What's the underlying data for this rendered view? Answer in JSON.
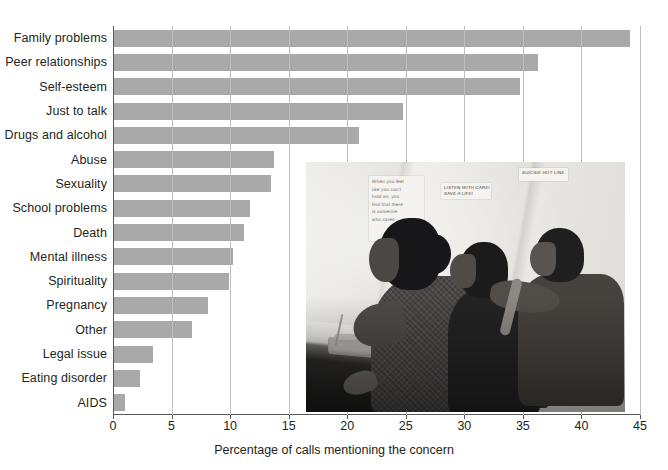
{
  "chart_data": {
    "type": "bar",
    "orientation": "horizontal",
    "title": "",
    "xlabel": "Percentage of calls mentioning the concern",
    "ylabel": "",
    "xlim": [
      0,
      45
    ],
    "xticks": [
      0,
      5,
      10,
      15,
      20,
      25,
      30,
      35,
      40,
      45
    ],
    "grid": true,
    "legend": false,
    "bar_color": "#a9a9a9",
    "categories": [
      "Family problems",
      "Peer relationships",
      "Self-esteem",
      "Just to talk",
      "Drugs and alcohol",
      "Abuse",
      "Sexuality",
      "School problems",
      "Death",
      "Mental illness",
      "Spirituality",
      "Pregnancy",
      "Other",
      "Legal issue",
      "Eating disorder",
      "AIDS"
    ],
    "values": [
      44.1,
      36.2,
      34.7,
      24.7,
      20.9,
      13.7,
      13.4,
      11.6,
      11.1,
      10.2,
      9.8,
      8.0,
      6.7,
      3.3,
      2.2,
      0.9
    ]
  },
  "photo": {
    "caption_alt": "Three teen volunteers answering calls at a peer telephone hotline",
    "signs": [
      {
        "name": "handwritten-note",
        "lines": [
          "When you feel",
          "like you can't",
          "hold on, you",
          "find that there",
          "is someone",
          "who cares"
        ]
      },
      {
        "name": "listen-sign",
        "lines": [
          "LISTEN WITH CARE!",
          "SAVE A LIFE!"
        ]
      },
      {
        "name": "suicide-sign",
        "lines": [
          "SUICIDE HOT LINE"
        ]
      }
    ]
  }
}
